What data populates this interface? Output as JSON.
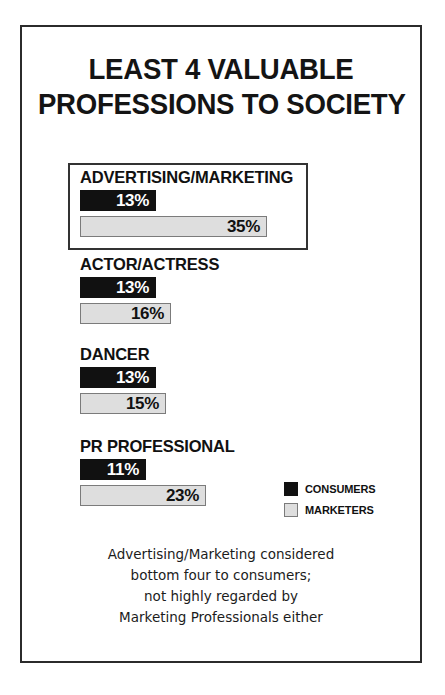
{
  "poster": {
    "title_lines": [
      "LEAST 4 VALUABLE",
      "PROFESSIONS TO SOCIETY"
    ],
    "caption_lines": [
      "Advertising/Marketing considered",
      "bottom four to consumers;",
      "not highly regarded by",
      "Marketing Professionals either"
    ]
  },
  "legend": {
    "items": [
      {
        "label": "CONSUMERS",
        "color": "#111111",
        "key": "consumers"
      },
      {
        "label": "MARKETERS",
        "color": "#dedede",
        "key": "marketers"
      }
    ]
  },
  "chart_data": {
    "type": "bar",
    "title": "LEAST 4 VALUABLE PROFESSIONS TO SOCIETY",
    "subtitle": "",
    "xlabel": "",
    "ylabel": "",
    "orientation": "horizontal",
    "grid": false,
    "legend_position": "middle-right",
    "xlim": [
      0,
      40
    ],
    "unit": "%",
    "categories": [
      "ADVERTISING/MARKETING",
      "ACTOR/ACTRESS",
      "DANCER",
      "PR PROFESSIONAL"
    ],
    "series": [
      {
        "name": "CONSUMERS",
        "color": "#111111",
        "values": [
          13,
          13,
          13,
          11
        ],
        "labels": [
          "13%",
          "13%",
          "13%",
          "11%"
        ]
      },
      {
        "name": "MARKETERS",
        "color": "#dedede",
        "values": [
          35,
          16,
          15,
          23
        ],
        "labels": [
          "35%",
          "16%",
          "15%",
          "23%"
        ]
      }
    ],
    "highlighted_category": "ADVERTISING/MARKETING",
    "annotation": "Advertising/Marketing considered bottom four to consumers; not highly regarded by Marketing Professionals either"
  },
  "layout": {
    "group_tops": [
      136,
      228,
      318,
      410
    ],
    "px_per_percent": 5.05,
    "bar_min_px": 10
  }
}
